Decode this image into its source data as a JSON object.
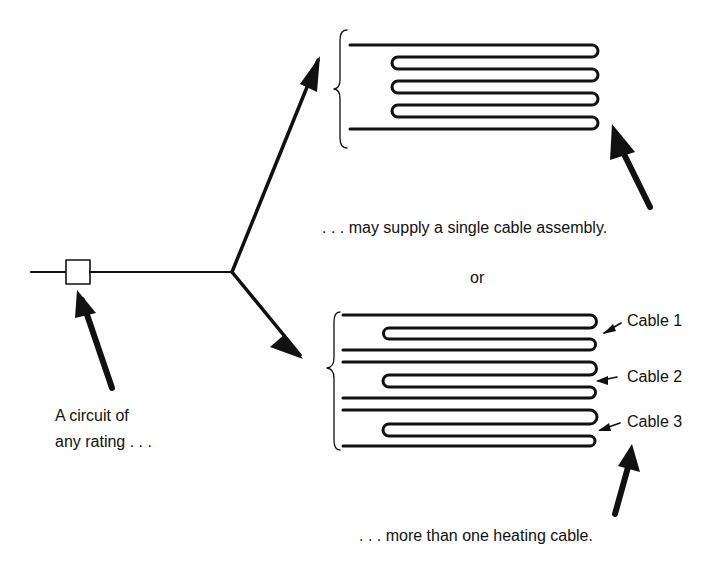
{
  "diagram": {
    "type": "circuit-heating-cable-illustration",
    "colors": {
      "ink": "#111111",
      "background": "#ffffff"
    },
    "labels": {
      "circuit": [
        "A circuit of",
        "any rating . . ."
      ],
      "single": ". . . may supply a single  cable assembly.",
      "or": "or",
      "multiple": ". . . more than one  heating cable."
    },
    "cables": [
      {
        "label": "Cable 1"
      },
      {
        "label": "Cable 2"
      },
      {
        "label": "Cable 3"
      }
    ]
  }
}
